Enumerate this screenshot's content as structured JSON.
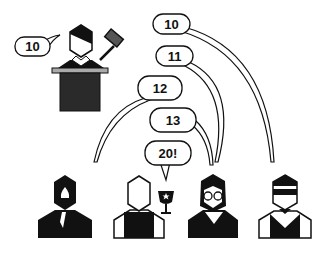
{
  "scene": {
    "description": "Auction illustration: auctioneer at podium with gavel, four bidders calling out bids",
    "auctioneer": {
      "bid": "10",
      "props": [
        "gavel-icon",
        "podium"
      ]
    },
    "bids": [
      {
        "label": "10",
        "bidder": "bidder-4-sunglasses"
      },
      {
        "label": "11",
        "bidder": "bidder-3-glasses"
      },
      {
        "label": "12",
        "bidder": "bidder-1-black-suit"
      },
      {
        "label": "13",
        "bidder": "bidder-3-glasses"
      },
      {
        "label": "20!",
        "bidder": "bidder-2-winner"
      }
    ],
    "bidders": [
      {
        "name": "bidder-1-black-suit"
      },
      {
        "name": "bidder-2-winner",
        "prop": "trophy-icon"
      },
      {
        "name": "bidder-3-glasses"
      },
      {
        "name": "bidder-4-sunglasses"
      }
    ],
    "colors": {
      "ink": "#111111",
      "gavel_head": "#555555",
      "podium_top": "#aaaaaa",
      "podium": "#2a2a2a",
      "background": "#ffffff"
    }
  }
}
